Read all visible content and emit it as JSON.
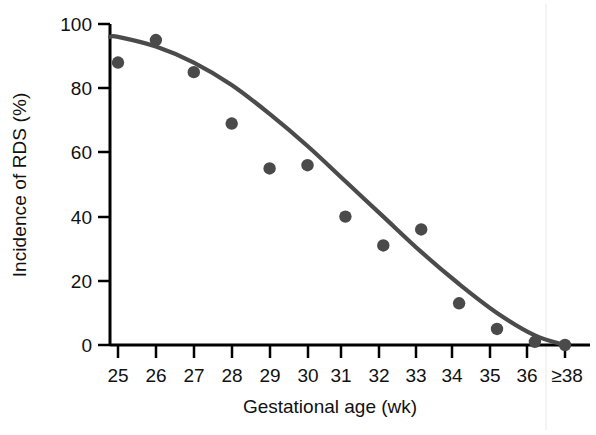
{
  "figure": {
    "title": "",
    "ylabel": "Incidence of RDS (%)",
    "xlabel": "Gestational age (wk)",
    "curve_label": "fitted-trend-curve",
    "curve_color": "#4b4b4b",
    "point_color": "#4a4a4a",
    "axis_color": "#000000",
    "background": "#ffffff",
    "ytick_labels": [
      "100",
      "80",
      "60",
      "40",
      "20",
      "0"
    ],
    "xtick_labels": [
      "25",
      "26",
      "27",
      "28",
      "29",
      "30",
      "31",
      "32",
      "33",
      "34",
      "35",
      "36",
      "≥38"
    ]
  },
  "chart_data": {
    "type": "scatter",
    "title": "",
    "xlabel": "Gestational age (wk)",
    "ylabel": "Incidence of RDS (%)",
    "categories": [
      "25",
      "26",
      "27",
      "28",
      "29",
      "30",
      "31",
      "32",
      "33",
      "34",
      "35",
      "36",
      "≥38"
    ],
    "x": [
      25,
      26,
      27,
      28,
      29,
      30,
      31,
      32,
      33,
      34,
      35,
      36,
      38
    ],
    "values": [
      88,
      95,
      85,
      69,
      55,
      56,
      40,
      31,
      36,
      13,
      5,
      1,
      0
    ],
    "series": [
      {
        "name": "Observed incidence",
        "type": "scatter",
        "values": [
          88,
          95,
          85,
          69,
          55,
          56,
          40,
          31,
          36,
          13,
          5,
          1,
          0
        ]
      },
      {
        "name": "Fitted curve",
        "type": "line",
        "x": [
          25,
          26,
          27,
          28,
          29,
          30,
          31,
          32,
          33,
          34,
          35,
          36,
          37
        ],
        "values": [
          96,
          93,
          88,
          81,
          72,
          62,
          51,
          40,
          29,
          19,
          10,
          3,
          0
        ]
      }
    ],
    "xlim": [
      24.5,
      38.5
    ],
    "ylim": [
      0,
      100
    ],
    "ytick_values": [
      0,
      20,
      40,
      60,
      80,
      100
    ],
    "grid": false,
    "legend": "none"
  }
}
